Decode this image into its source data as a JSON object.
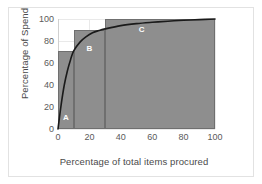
{
  "chart_data": {
    "type": "bar",
    "title": "",
    "xlabel": "Percentage of total items procured",
    "ylabel": "Percentage of Spend",
    "xlim": [
      0,
      100
    ],
    "ylim": [
      0,
      100
    ],
    "xticks": [
      0,
      20,
      40,
      60,
      80,
      100
    ],
    "yticks": [
      0,
      20,
      40,
      60,
      80,
      100
    ],
    "grid": true,
    "legend": "none",
    "categories": [
      "A",
      "B",
      "C"
    ],
    "series": [
      {
        "name": "Category bands",
        "type": "bar",
        "bars": [
          {
            "label": "A",
            "x_start": 0,
            "x_end": 10,
            "value": 71
          },
          {
            "label": "B",
            "x_start": 10,
            "x_end": 30,
            "value": 90
          },
          {
            "label": "C",
            "x_start": 30,
            "x_end": 100,
            "value": 100
          }
        ]
      },
      {
        "name": "Cumulative spend curve",
        "type": "line",
        "x": [
          0,
          2,
          4,
          6,
          8,
          10,
          14,
          18,
          22,
          26,
          30,
          40,
          50,
          60,
          70,
          80,
          90,
          100
        ],
        "values": [
          0,
          22,
          40,
          53,
          63,
          71,
          79,
          84,
          87.5,
          89.5,
          91,
          94,
          95.8,
          97,
          98,
          98.8,
          99.4,
          100
        ]
      }
    ],
    "colors": {
      "bar_fill": "#8e8e8e",
      "bar_stroke": "#6f6f6f",
      "curve": "#1a1a1a",
      "grid": "#e9e9e9",
      "axis": "#b9b9b9",
      "text": "#5a5a5a",
      "bar_label_text": "#ffffff",
      "frame": "#e2e2e2",
      "background": "#ffffff"
    }
  }
}
